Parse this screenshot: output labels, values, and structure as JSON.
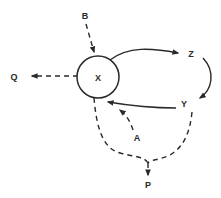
{
  "diagram": {
    "type": "flow-diagram",
    "nodes": {
      "x": {
        "label": "X",
        "shape": "circle"
      },
      "b": {
        "label": "B"
      },
      "q": {
        "label": "Q"
      },
      "z": {
        "label": "Z"
      },
      "y": {
        "label": "Y"
      },
      "a": {
        "label": "A"
      },
      "p": {
        "label": "P"
      }
    },
    "edges": [
      {
        "from": "B",
        "to": "X",
        "style": "dashed"
      },
      {
        "from": "X",
        "to": "Q",
        "style": "dashed"
      },
      {
        "from": "X",
        "to": "Z",
        "style": "solid"
      },
      {
        "from": "Z",
        "to": "Y",
        "style": "solid"
      },
      {
        "from": "Y",
        "to": "X",
        "style": "solid"
      },
      {
        "from": "A",
        "to": "X",
        "style": "dashed"
      },
      {
        "from": "X",
        "to": "P",
        "style": "dashed",
        "via": "junction"
      },
      {
        "from": "Y",
        "to": "P",
        "style": "dashed",
        "via": "junction"
      }
    ],
    "colors": {
      "ink": "#2a2a2a",
      "background": "#ffffff"
    }
  }
}
